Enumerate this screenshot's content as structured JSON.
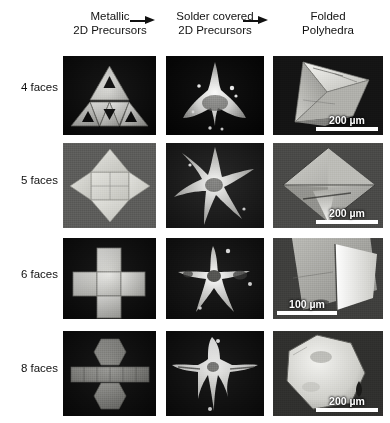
{
  "figure": {
    "columns": [
      {
        "id": "metallic",
        "line1": "Metallic",
        "line2": "2D Precursors"
      },
      {
        "id": "solder",
        "line1": "Solder covered",
        "line2": "2D Precursors"
      },
      {
        "id": "folded",
        "line1": "Folded",
        "line2": "Polyhedra"
      }
    ],
    "arrows": [
      {
        "id": "arrow-1",
        "label": "right-arrow"
      },
      {
        "id": "arrow-2",
        "label": "right-arrow"
      }
    ],
    "rows": [
      {
        "id": "row-4-faces",
        "label": "4 faces",
        "precursor_shape": "triangular net of four triangles with triangular perforations",
        "solder_shape": "solder covered triangular net",
        "polyhedron": "tetrahedron",
        "scale_bar": {
          "value": "200",
          "unit": "µm",
          "text": "200 µm",
          "position": "bottom-right"
        }
      },
      {
        "id": "row-5-faces",
        "label": "5 faces",
        "precursor_shape": "square with four triangular flaps",
        "solder_shape": "solder covered four point star",
        "polyhedron": "square pyramid",
        "scale_bar": {
          "value": "200",
          "unit": "µm",
          "text": "200 µm",
          "position": "bottom-right"
        }
      },
      {
        "id": "row-6-faces",
        "label": "6 faces",
        "precursor_shape": "cross shaped net of six squares",
        "solder_shape": "solder covered cross net",
        "polyhedron": "cube",
        "scale_bar": {
          "value": "100",
          "unit": "µm",
          "text": "100 µm",
          "position": "bottom-left"
        }
      },
      {
        "id": "row-8-faces",
        "label": "8 faces",
        "precursor_shape": "two hexagons with a strip of six rectangles",
        "solder_shape": "solder covered hexagonal prism net",
        "polyhedron": "hexagonal prism",
        "scale_bar": {
          "value": "200",
          "unit": "µm",
          "text": "200 µm",
          "position": "bottom-right"
        }
      }
    ],
    "colors": {
      "background": "#ffffff",
      "text": "#111111",
      "panel_dark": "#0a0a0a",
      "panel_gray": "#6b6b6b",
      "scale_bar": "#ffffff"
    }
  }
}
